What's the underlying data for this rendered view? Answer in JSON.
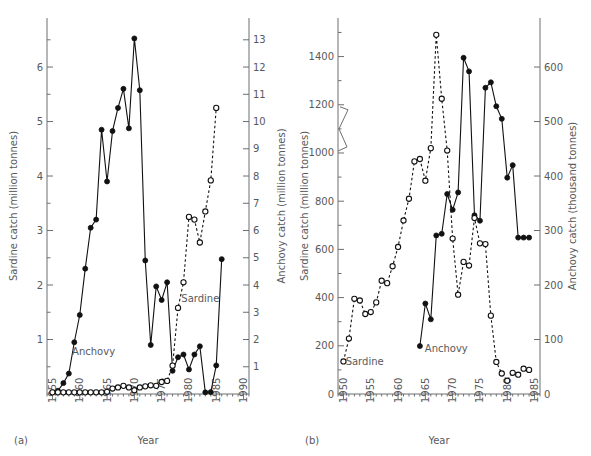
{
  "figure": {
    "background": "#ffffff",
    "ink": "#111111",
    "axis_color": "#6d6e71",
    "text_color": "#58595b"
  },
  "panels": [
    {
      "id": "a",
      "label": "(a)",
      "xlabel": "Year",
      "left_axis_title": "Sardine catch (million tonnes)",
      "right_axis_title": "Anchovy catch (million tonnes)",
      "x_ticks": [
        1955,
        1960,
        1965,
        1970,
        1975,
        1980,
        1985,
        1990
      ],
      "x_minor_step": 1,
      "xlim": [
        1954,
        1991
      ],
      "left_ticks": [
        1,
        2,
        3,
        4,
        5,
        6
      ],
      "left_minor": [
        0.5,
        1.5,
        2.5,
        3.5,
        4.5,
        5.5,
        6.5
      ],
      "left_lim": [
        0,
        6.9
      ],
      "right_ticks": [
        1,
        2,
        3,
        4,
        5,
        6,
        7,
        8,
        9,
        10,
        11,
        12,
        13
      ],
      "right_lim": [
        0,
        13.8
      ],
      "series_labels": {
        "anchovy": "Anchovy",
        "sardine": "Sardine"
      }
    },
    {
      "id": "b",
      "label": "(b)",
      "xlabel": "Year",
      "left_axis_title": "Sardine catch (million tonnes)",
      "right_axis_title": "Anchovy catch (thousand tonnes)",
      "x_ticks": [
        1950,
        1955,
        1960,
        1965,
        1970,
        1975,
        1980,
        1985
      ],
      "x_minor_step": 1,
      "xlim": [
        1949,
        1986
      ],
      "left_ticks": [
        0,
        200,
        400,
        600,
        800,
        1000,
        1200,
        1400
      ],
      "left_minor": [
        100,
        300,
        500,
        700,
        900,
        1100,
        1300,
        1500
      ],
      "left_lim": [
        0,
        1560
      ],
      "axis_break_between": [
        1000,
        1200
      ],
      "right_ticks": [
        0,
        100,
        200,
        300,
        400,
        500,
        600
      ],
      "right_lim": [
        0,
        690
      ],
      "series_labels": {
        "anchovy": "Anchovy",
        "sardine": "Sardine"
      }
    }
  ],
  "chart_data": [
    {
      "type": "line",
      "panel": "a",
      "title": "",
      "xlabel": "Year",
      "ylabel": "Sardine catch (million tonnes)",
      "y2label": "Anchovy catch (million tonnes)",
      "xlim": [
        1954,
        1991
      ],
      "ylim": [
        0,
        6.9
      ],
      "y2lim": [
        0,
        13.8
      ],
      "grid": false,
      "legend": "inline-annotations",
      "series": [
        {
          "name": "Anchovy",
          "axis": "right",
          "marker": "filled-circle",
          "line": "solid",
          "units": "million tonnes",
          "x": [
            1955,
            1956,
            1957,
            1958,
            1959,
            1960,
            1961,
            1962,
            1963,
            1964,
            1965,
            1966,
            1967,
            1968,
            1969,
            1970,
            1971,
            1972,
            1973,
            1974,
            1975,
            1976,
            1977,
            1978,
            1979,
            1980,
            1981,
            1982,
            1983,
            1984,
            1985,
            1986
          ],
          "values": [
            0.06,
            0.12,
            0.4,
            0.75,
            1.9,
            2.9,
            4.6,
            6.1,
            6.4,
            9.7,
            7.8,
            9.65,
            10.5,
            11.2,
            9.75,
            13.05,
            11.15,
            4.9,
            1.8,
            3.95,
            3.45,
            4.1,
            0.85,
            1.35,
            1.45,
            0.9,
            1.45,
            1.75,
            0.06,
            0.07,
            1.05,
            4.95
          ]
        },
        {
          "name": "Sardine",
          "axis": "left",
          "marker": "open-circle",
          "line": "dashed",
          "units": "million tonnes",
          "x": [
            1955,
            1956,
            1957,
            1958,
            1959,
            1960,
            1961,
            1962,
            1963,
            1964,
            1965,
            1966,
            1967,
            1968,
            1969,
            1970,
            1971,
            1972,
            1973,
            1974,
            1975,
            1976,
            1977,
            1978,
            1979,
            1980,
            1981,
            1982,
            1983,
            1984,
            1985
          ],
          "values": [
            0.03,
            0.03,
            0.03,
            0.03,
            0.03,
            0.03,
            0.03,
            0.03,
            0.03,
            0.03,
            0.04,
            0.1,
            0.12,
            0.15,
            0.12,
            0.07,
            0.12,
            0.14,
            0.16,
            0.15,
            0.22,
            0.24,
            0.52,
            1.58,
            2.05,
            3.25,
            3.2,
            2.78,
            3.35,
            3.92,
            5.25,
            4.35
          ]
        }
      ]
    },
    {
      "type": "line",
      "panel": "b",
      "title": "",
      "xlabel": "Year",
      "ylabel": "Sardine catch (million tonnes)",
      "y2label": "Anchovy catch (thousand tonnes)",
      "xlim": [
        1949,
        1986
      ],
      "ylim": [
        0,
        1560
      ],
      "y2lim": [
        0,
        690
      ],
      "grid": false,
      "legend": "inline-annotations",
      "series": [
        {
          "name": "Anchovy",
          "axis": "right",
          "marker": "filled-circle",
          "line": "solid",
          "units": "thousand tonnes",
          "x": [
            1964,
            1965,
            1966,
            1967,
            1968,
            1969,
            1970,
            1971,
            1972,
            1973,
            1974,
            1975,
            1976,
            1977,
            1978,
            1979,
            1980,
            1981,
            1982,
            1983,
            1984
          ],
          "values": [
            88,
            166,
            137,
            291,
            294,
            367,
            338,
            370,
            617,
            592,
            328,
            318,
            562,
            572,
            528,
            505,
            397,
            420,
            287,
            287,
            287
          ]
        },
        {
          "name": "Sardine",
          "axis": "left",
          "marker": "open-circle",
          "line": "dashed",
          "units": "million tonnes",
          "x": [
            1950,
            1951,
            1952,
            1953,
            1954,
            1955,
            1956,
            1957,
            1958,
            1959,
            1960,
            1961,
            1962,
            1963,
            1964,
            1965,
            1966,
            1967,
            1968,
            1969,
            1970,
            1971,
            1972,
            1973,
            1974,
            1975,
            1976,
            1977,
            1978,
            1979,
            1980,
            1981,
            1982,
            1983,
            1984
          ],
          "values": [
            135,
            230,
            395,
            388,
            332,
            340,
            380,
            470,
            460,
            530,
            610,
            720,
            810,
            965,
            975,
            885,
            1020,
            1490,
            1225,
            1010,
            645,
            412,
            548,
            533,
            730,
            625,
            622,
            325,
            133,
            85,
            55,
            88,
            80,
            105,
            100
          ]
        }
      ]
    }
  ]
}
